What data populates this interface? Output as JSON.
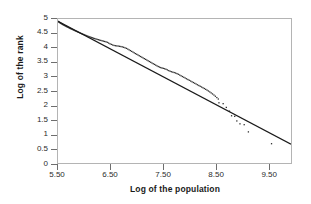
{
  "chart_data": {
    "type": "scatter",
    "title": "",
    "xlabel": "Log of the population",
    "ylabel": "Log of the rank",
    "xlim": [
      5.5,
      9.93
    ],
    "ylim": [
      0,
      5
    ],
    "xticks": [
      5.5,
      6.5,
      7.5,
      8.5,
      9.5
    ],
    "xtick_labels": [
      "5.50",
      "6.50",
      "7.50",
      "8.50",
      "9.50"
    ],
    "yticks": [
      0,
      0.5,
      1,
      1.5,
      2,
      2.5,
      3,
      3.5,
      4,
      4.5,
      5
    ],
    "ytick_labels": [
      "0",
      "0.5",
      "1",
      "1.5",
      "2",
      "2.5",
      "3",
      "3.5",
      "4",
      "4.5",
      "5"
    ],
    "grid": false,
    "legend": "none",
    "marker": "small-dot",
    "series": [
      {
        "name": "Observed rank-size data",
        "type": "scatter",
        "color": "#2b2b2b",
        "points": [
          [
            5.505,
            4.915
          ],
          [
            5.515,
            4.9
          ],
          [
            5.525,
            4.884
          ],
          [
            5.536,
            4.869
          ],
          [
            5.548,
            4.855
          ],
          [
            5.56,
            4.842
          ],
          [
            5.573,
            4.828
          ],
          [
            5.586,
            4.812
          ],
          [
            5.6,
            4.797
          ],
          [
            5.614,
            4.783
          ],
          [
            5.628,
            4.77
          ],
          [
            5.643,
            4.756
          ],
          [
            5.658,
            4.741
          ],
          [
            5.672,
            4.726
          ],
          [
            5.688,
            4.712
          ],
          [
            5.704,
            4.698
          ],
          [
            5.72,
            4.684
          ],
          [
            5.736,
            4.669
          ],
          [
            5.752,
            4.654
          ],
          [
            5.769,
            4.64
          ],
          [
            5.786,
            4.625
          ],
          [
            5.803,
            4.61
          ],
          [
            5.82,
            4.596
          ],
          [
            5.838,
            4.581
          ],
          [
            5.856,
            4.566
          ],
          [
            5.874,
            4.551
          ],
          [
            5.892,
            4.536
          ],
          [
            5.911,
            4.521
          ],
          [
            5.93,
            4.506
          ],
          [
            5.949,
            4.492
          ],
          [
            5.968,
            4.477
          ],
          [
            5.988,
            4.462
          ],
          [
            6.008,
            4.447
          ],
          [
            6.028,
            4.432
          ],
          [
            6.048,
            4.418
          ],
          [
            6.069,
            4.403
          ],
          [
            6.09,
            4.389
          ],
          [
            6.111,
            4.375
          ],
          [
            6.132,
            4.361
          ],
          [
            6.154,
            4.347
          ],
          [
            6.176,
            4.333
          ],
          [
            6.198,
            4.32
          ],
          [
            6.221,
            4.307
          ],
          [
            6.244,
            4.294
          ],
          [
            6.267,
            4.281
          ],
          [
            6.29,
            4.268
          ],
          [
            6.314,
            4.256
          ],
          [
            6.338,
            4.244
          ],
          [
            6.362,
            4.232
          ],
          [
            6.387,
            4.22
          ],
          [
            6.412,
            4.208
          ],
          [
            6.437,
            4.19
          ],
          [
            6.462,
            4.165
          ],
          [
            6.488,
            4.14
          ],
          [
            6.514,
            4.118
          ],
          [
            6.54,
            4.098
          ],
          [
            6.566,
            4.082
          ],
          [
            6.592,
            4.072
          ],
          [
            6.618,
            4.066
          ],
          [
            6.644,
            4.06
          ],
          [
            6.67,
            4.052
          ],
          [
            6.696,
            4.043
          ],
          [
            6.722,
            4.032
          ],
          [
            6.748,
            4.018
          ],
          [
            6.774,
            4.0
          ],
          [
            6.8,
            3.98
          ],
          [
            6.826,
            3.956
          ],
          [
            6.851,
            3.93
          ],
          [
            6.876,
            3.903
          ],
          [
            6.901,
            3.876
          ],
          [
            6.926,
            3.85
          ],
          [
            6.95,
            3.824
          ],
          [
            6.974,
            3.798
          ],
          [
            6.998,
            3.773
          ],
          [
            7.022,
            3.748
          ],
          [
            7.046,
            3.723
          ],
          [
            7.07,
            3.698
          ],
          [
            7.094,
            3.673
          ],
          [
            7.118,
            3.648
          ],
          [
            7.142,
            3.623
          ],
          [
            7.166,
            3.598
          ],
          [
            7.19,
            3.573
          ],
          [
            7.214,
            3.548
          ],
          [
            7.238,
            3.523
          ],
          [
            7.262,
            3.498
          ],
          [
            7.286,
            3.473
          ],
          [
            7.31,
            3.448
          ],
          [
            7.334,
            3.423
          ],
          [
            7.358,
            3.398
          ],
          [
            7.382,
            3.373
          ],
          [
            7.406,
            3.35
          ],
          [
            7.43,
            3.33
          ],
          [
            7.454,
            3.312
          ],
          [
            7.478,
            3.298
          ],
          [
            7.502,
            3.286
          ],
          [
            7.528,
            3.272
          ],
          [
            7.554,
            3.254
          ],
          [
            7.58,
            3.232
          ],
          [
            7.606,
            3.208
          ],
          [
            7.632,
            3.186
          ],
          [
            7.658,
            3.168
          ],
          [
            7.684,
            3.154
          ],
          [
            7.71,
            3.14
          ],
          [
            7.736,
            3.124
          ],
          [
            7.762,
            3.104
          ],
          [
            7.788,
            3.08
          ],
          [
            7.814,
            3.054
          ],
          [
            7.84,
            3.028
          ],
          [
            7.866,
            3.002
          ],
          [
            7.892,
            2.976
          ],
          [
            7.918,
            2.95
          ],
          [
            7.944,
            2.924
          ],
          [
            7.97,
            2.898
          ],
          [
            7.996,
            2.872
          ],
          [
            8.022,
            2.846
          ],
          [
            8.048,
            2.82
          ],
          [
            8.074,
            2.794
          ],
          [
            8.1,
            2.768
          ],
          [
            8.126,
            2.742
          ],
          [
            8.152,
            2.716
          ],
          [
            8.178,
            2.69
          ],
          [
            8.204,
            2.664
          ],
          [
            8.23,
            2.638
          ],
          [
            8.256,
            2.612
          ],
          [
            8.282,
            2.586
          ],
          [
            8.308,
            2.558
          ],
          [
            8.334,
            2.53
          ],
          [
            8.36,
            2.5
          ],
          [
            8.386,
            2.468
          ],
          [
            8.412,
            2.434
          ],
          [
            8.438,
            2.398
          ],
          [
            8.465,
            2.36
          ],
          [
            8.492,
            2.318
          ],
          [
            8.52,
            2.272
          ],
          [
            8.548,
            2.222
          ],
          [
            8.56,
            2.09
          ],
          [
            8.64,
            2.06
          ],
          [
            8.7,
            1.93
          ],
          [
            8.76,
            1.8
          ],
          [
            8.8,
            1.64
          ],
          [
            8.86,
            1.62
          ],
          [
            8.9,
            1.46
          ],
          [
            8.96,
            1.36
          ],
          [
            9.04,
            1.33
          ],
          [
            9.12,
            1.08
          ],
          [
            9.56,
            0.67
          ]
        ]
      },
      {
        "name": "Fitted regression line",
        "type": "line",
        "color": "#1a1a1a",
        "points": [
          [
            5.5,
            4.92
          ],
          [
            9.93,
            0.65
          ]
        ],
        "slope": -0.964,
        "intercept": 10.222
      }
    ]
  },
  "axes": {
    "x_title": "Log of the population",
    "y_title": "Log of the rank"
  }
}
